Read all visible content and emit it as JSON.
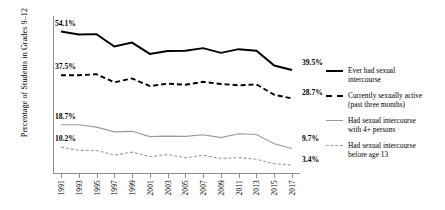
{
  "chart_data": {
    "type": "line",
    "title": "",
    "xlabel": "",
    "ylabel": "Percentage of Students in Grades 9–12",
    "x": [
      1991,
      1993,
      1995,
      1997,
      1999,
      2001,
      2003,
      2005,
      2007,
      2009,
      2011,
      2013,
      2015,
      2017
    ],
    "xlim": [
      1991,
      2017
    ],
    "ylim": [
      0,
      60
    ],
    "grid": false,
    "legend_position": "right",
    "series": [
      {
        "name": "Ever had sexual intercourse",
        "style": "solid",
        "color": "#000000",
        "start_label": "54.1%",
        "end_label": "39.5%",
        "values": [
          54.1,
          53.0,
          53.1,
          48.4,
          49.9,
          45.6,
          46.7,
          46.8,
          47.8,
          46.0,
          47.4,
          46.8,
          41.2,
          39.5
        ]
      },
      {
        "name": "Currently sexually active (past three months)",
        "style": "dashed",
        "color": "#000000",
        "start_label": "37.5%",
        "end_label": "28.7%",
        "values": [
          37.5,
          37.5,
          37.9,
          34.8,
          36.3,
          33.4,
          34.3,
          33.9,
          35.0,
          34.2,
          33.7,
          34.0,
          30.1,
          28.7
        ]
      },
      {
        "name": "Had sexual intercourse with 4+ persons",
        "style": "solid",
        "color": "#9a9a9a",
        "start_label": "18.7%",
        "end_label": "9.7%",
        "values": [
          18.7,
          18.7,
          17.8,
          16.0,
          16.2,
          14.2,
          14.4,
          14.3,
          14.9,
          13.8,
          15.3,
          15.0,
          11.5,
          9.7
        ]
      },
      {
        "name": "Had sexual intercourse before age 13",
        "style": "dashed",
        "color": "#9a9a9a",
        "start_label": "10.2%",
        "end_label": "3.4%",
        "values": [
          10.2,
          9.0,
          8.9,
          7.2,
          8.3,
          6.6,
          7.4,
          6.2,
          7.1,
          5.9,
          6.2,
          5.6,
          3.9,
          3.4
        ]
      }
    ]
  },
  "axis": {
    "tick_labels": [
      "1991",
      "1993",
      "1995",
      "1997",
      "1999",
      "2001",
      "2003",
      "2005",
      "2007",
      "2009",
      "2011",
      "2013",
      "2015",
      "2017"
    ]
  },
  "legend": {
    "items": [
      {
        "line1": "Ever had sexual",
        "line2": "intercourse"
      },
      {
        "line1": "Currently sexually active",
        "line2": "(past three months)"
      },
      {
        "line1": "Had sexual intercourse",
        "line2": "with 4+ persons"
      },
      {
        "line1": "Had sexual intercourse",
        "line2": "before age 13"
      }
    ]
  }
}
